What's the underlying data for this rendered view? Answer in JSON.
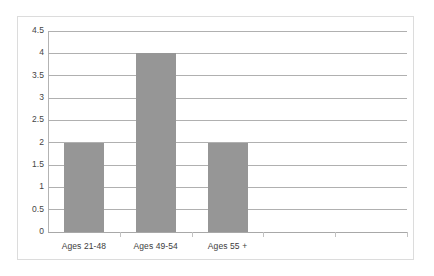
{
  "chart_data": {
    "type": "bar",
    "title": "",
    "subtitle": "",
    "xlabel": "",
    "ylabel": "",
    "categories": [
      "Ages 21-48",
      "Ages 49-54",
      "Ages 55 +"
    ],
    "values": [
      2,
      4,
      2
    ],
    "series": [
      {
        "name": "",
        "values": [
          2,
          4,
          2
        ]
      }
    ],
    "ylim": [
      0,
      4.5
    ],
    "y_ticks": [
      "0",
      "0.5",
      "1",
      "1.5",
      "2",
      "2.5",
      "3",
      "3.5",
      "4",
      "4.5"
    ],
    "y_tick_values": [
      0,
      0.5,
      1,
      1.5,
      2,
      2.5,
      3,
      3.5,
      4,
      4.5
    ],
    "grid": true,
    "legend": false,
    "legend_position": "none",
    "annotations": [],
    "colors": {
      "bar": "#969696",
      "gridline": "#b0b0b0",
      "axis": "#a8a8a8",
      "frame": "#dcdcdc",
      "plot_background": "#ffffff",
      "tick_label": "#444444",
      "category_label": "#3d3d3d"
    }
  }
}
